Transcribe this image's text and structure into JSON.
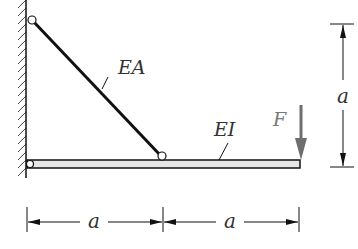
{
  "diagram": {
    "type": "structural-mechanics",
    "labels": {
      "bar_stiffness": "EA",
      "beam_stiffness": "EI",
      "force": "F",
      "vertical_dim": "a",
      "horizontal_dim_left": "a",
      "horizontal_dim_right": "a"
    },
    "colors": {
      "line": "#111111",
      "beam_fill": "#e6e6e6",
      "force_arrow": "#6e6e6e",
      "hatch": "#555555"
    }
  }
}
